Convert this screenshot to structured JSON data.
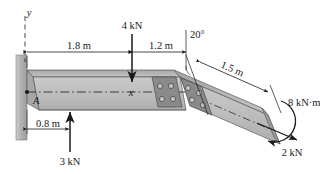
{
  "figure": {
    "axes": {
      "y_label": "y",
      "x_label": "x"
    },
    "points": {
      "a_label": "A"
    },
    "dimensions": [
      {
        "name": "span-1",
        "value": "1.8 m"
      },
      {
        "name": "span-2",
        "value": "1.2 m"
      },
      {
        "name": "span-3",
        "value": "1.5 m"
      },
      {
        "name": "span-4",
        "value": "0.8 m"
      }
    ],
    "angles": [
      {
        "name": "bend-angle",
        "value": "20°"
      }
    ],
    "loads": [
      {
        "name": "load-4kn",
        "value": "4 kN",
        "direction": "down"
      },
      {
        "name": "load-3kn",
        "value": "3 kN",
        "direction": "up"
      },
      {
        "name": "load-2kn",
        "value": "2 kN",
        "direction": "right-down"
      },
      {
        "name": "moment-8knm",
        "value": "8 kN·m",
        "direction": "curved"
      }
    ],
    "colors": {
      "beam_face": "#b9b9b9",
      "beam_light": "#cfcfcf",
      "beam_dark": "#8f8f8f",
      "plate_dark": "#868686",
      "wall": "#b0b0b0",
      "outline": "#1a1a1a",
      "text": "#1a1a1a"
    }
  }
}
